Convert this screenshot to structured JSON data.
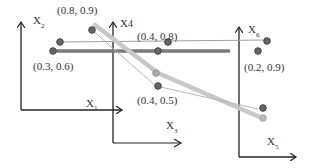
{
  "diagram": {
    "title": "",
    "axes": [
      {
        "id": "x1",
        "label": "X",
        "sub": "1"
      },
      {
        "id": "x2",
        "label": "X",
        "sub": "2"
      },
      {
        "id": "x3",
        "label": "X",
        "sub": "3"
      },
      {
        "id": "x4",
        "label": "X",
        "sub": "4"
      },
      {
        "id": "x5",
        "label": "X",
        "sub": "5"
      },
      {
        "id": "x6",
        "label": "X",
        "sub": "6"
      }
    ],
    "point_labels": {
      "p1": "(0.8, 0.9)",
      "p2": "(0.4, 0.8)",
      "p3": "(0.3, 0.6)",
      "p4": "(0.2, 0.9)",
      "p5": "(0.4, 0.5)"
    },
    "colors": {
      "axis": "#222222",
      "thick_dark_line": "#7a7a7a",
      "thin_dark_line": "#9a9a9a",
      "thick_light_line": "#c4c4c4",
      "thin_light_line": "#b0b0b0",
      "dot": "#555555",
      "dot_light": "#aaaaaa"
    }
  }
}
